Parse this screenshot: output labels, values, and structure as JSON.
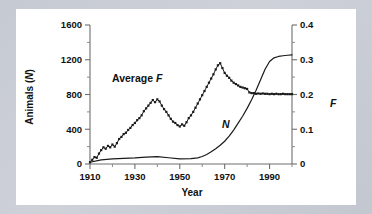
{
  "figure": {
    "background_color": "#c9ccd4",
    "panel_color": "#ffffff",
    "line_color": "#1a1a1a",
    "axis_color": "#6e6e6e"
  },
  "labels": {
    "left_axis_title": "Animals (N)",
    "left_axis_title_plain": "Animals (",
    "left_axis_title_italic": "N",
    "left_axis_title_close": ")",
    "right_axis_title": "F",
    "x_axis_title": "Year",
    "series_f_label_plain": "Average ",
    "series_f_label_italic": "F",
    "series_n_label": "N"
  },
  "chart_data": {
    "type": "line",
    "title": "",
    "xlabel": "Year",
    "ylabel": "Animals (N)",
    "y2label": "F",
    "xlim": [
      1910,
      2000
    ],
    "ylim": [
      0,
      1600
    ],
    "y2lim": [
      0,
      0.4
    ],
    "grid": false,
    "legend_position": "inline-annotations",
    "xticks": [
      1910,
      1930,
      1950,
      1970,
      1990
    ],
    "xticks_minor": [
      1920,
      1940,
      1960,
      1980,
      2000
    ],
    "yticks": [
      0,
      400,
      800,
      1200,
      1600
    ],
    "yticks_minor": [
      200,
      600,
      1000,
      1400
    ],
    "y2ticks": [
      0,
      0.1,
      0.2,
      0.3,
      0.4
    ],
    "y2ticks_minor": [
      0.05,
      0.15,
      0.25,
      0.35
    ],
    "series": [
      {
        "name": "Average F",
        "axis": "right",
        "style": "line-with-markers",
        "x": [
          1910,
          1911,
          1912,
          1913,
          1914,
          1915,
          1916,
          1917,
          1918,
          1919,
          1920,
          1921,
          1922,
          1923,
          1924,
          1925,
          1926,
          1927,
          1928,
          1929,
          1930,
          1931,
          1932,
          1933,
          1934,
          1935,
          1936,
          1937,
          1938,
          1939,
          1940,
          1941,
          1942,
          1943,
          1944,
          1945,
          1946,
          1947,
          1948,
          1949,
          1950,
          1951,
          1952,
          1953,
          1954,
          1955,
          1956,
          1957,
          1958,
          1959,
          1960,
          1961,
          1962,
          1963,
          1964,
          1965,
          1966,
          1967,
          1968,
          1969,
          1970,
          1971,
          1972,
          1973,
          1974,
          1975,
          1976,
          1977,
          1978,
          1979,
          1980,
          1981,
          1982,
          1983,
          1984,
          1985,
          1986,
          1987,
          1988,
          1989,
          1990,
          1991,
          1992,
          1993,
          1994,
          1995,
          1996,
          1997,
          1998,
          1999,
          2000
        ],
        "y": [
          0.005,
          0.012,
          0.02,
          0.018,
          0.03,
          0.04,
          0.048,
          0.044,
          0.052,
          0.048,
          0.056,
          0.05,
          0.06,
          0.072,
          0.078,
          0.086,
          0.09,
          0.098,
          0.104,
          0.112,
          0.118,
          0.126,
          0.132,
          0.14,
          0.152,
          0.16,
          0.168,
          0.176,
          0.184,
          0.178,
          0.186,
          0.18,
          0.168,
          0.158,
          0.15,
          0.14,
          0.13,
          0.122,
          0.118,
          0.112,
          0.108,
          0.114,
          0.11,
          0.12,
          0.132,
          0.14,
          0.15,
          0.162,
          0.174,
          0.186,
          0.198,
          0.21,
          0.222,
          0.234,
          0.246,
          0.258,
          0.272,
          0.284,
          0.29,
          0.276,
          0.262,
          0.254,
          0.248,
          0.24,
          0.234,
          0.23,
          0.226,
          0.222,
          0.22,
          0.218,
          0.216,
          0.206,
          0.204,
          0.204,
          0.202,
          0.203,
          0.202,
          0.203,
          0.202,
          0.202,
          0.201,
          0.202,
          0.201,
          0.202,
          0.201,
          0.201,
          0.202,
          0.201,
          0.201,
          0.201,
          0.201
        ]
      },
      {
        "name": "N",
        "axis": "left",
        "style": "line",
        "x": [
          1910,
          1915,
          1920,
          1925,
          1930,
          1935,
          1940,
          1945,
          1950,
          1955,
          1958,
          1960,
          1962,
          1964,
          1966,
          1968,
          1970,
          1972,
          1974,
          1976,
          1978,
          1980,
          1982,
          1984,
          1986,
          1988,
          1990,
          1992,
          1994,
          1996,
          1998,
          2000
        ],
        "y": [
          20,
          48,
          58,
          64,
          70,
          80,
          86,
          72,
          58,
          62,
          70,
          86,
          110,
          140,
          176,
          216,
          262,
          320,
          390,
          470,
          550,
          640,
          740,
          850,
          970,
          1090,
          1180,
          1222,
          1238,
          1246,
          1252,
          1256
        ]
      }
    ]
  }
}
